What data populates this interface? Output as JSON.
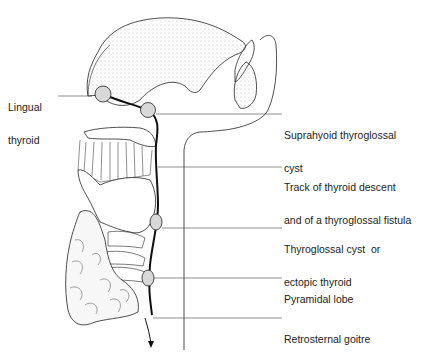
{
  "diagram": {
    "labels": [
      {
        "id": "lingual",
        "line1": "Lingual",
        "line2": "thyroid",
        "x": 8,
        "y": 80
      },
      {
        "id": "suprahyoid",
        "line1": "Suprahyoid thyroglossal",
        "line2": "cyst",
        "x": 284,
        "y": 109
      },
      {
        "id": "track",
        "line1": "Track of thyroid descent",
        "line2": "and of a thyroglossal fistula",
        "x": 284,
        "y": 158
      },
      {
        "id": "thyroglossal-cyst",
        "line1": "Thyroglossal cyst  or",
        "line2": "ectopic thyroid",
        "x": 284,
        "y": 221
      },
      {
        "id": "pyramidal",
        "line1": "Pyramidal lobe",
        "line2": "",
        "x": 284,
        "y": 270
      },
      {
        "id": "retrosternal",
        "line1": "Retrosternal goitre",
        "line2": "",
        "x": 284,
        "y": 311
      }
    ],
    "colors": {
      "line": "#222222",
      "node_fill": "#d8d8d8",
      "stipple": "#bbbbbb"
    }
  }
}
